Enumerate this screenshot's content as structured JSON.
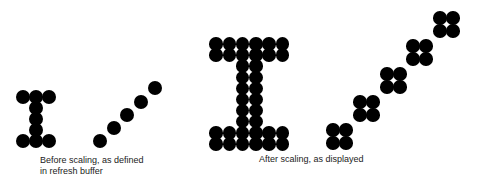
{
  "figure": {
    "left_caption_line1": "Before scaling, as defined",
    "left_caption_line2": "in refresh buffer",
    "right_caption": "After scaling, as displayed",
    "dot_color": "#000000",
    "small_dot_diameter": 14,
    "large_dot_diameter": 13.5,
    "small_I": [
      [
        23,
        97
      ],
      [
        36,
        97
      ],
      [
        49,
        97
      ],
      [
        36,
        108
      ],
      [
        36,
        119
      ],
      [
        36,
        130
      ],
      [
        23,
        141
      ],
      [
        36,
        141
      ],
      [
        49,
        141
      ]
    ],
    "small_diagonal": [
      [
        100,
        141
      ],
      [
        114,
        128
      ],
      [
        127,
        115
      ],
      [
        141,
        102
      ],
      [
        155,
        88
      ]
    ],
    "large_I_origin": [
      216,
      44
    ],
    "large_I_pitch": [
      13.3,
      11.1
    ],
    "large_I_grid": [
      [
        1,
        1,
        1,
        1,
        1,
        1
      ],
      [
        1,
        1,
        1,
        1,
        1,
        1
      ],
      [
        0,
        0,
        1,
        1,
        0,
        0
      ],
      [
        0,
        0,
        1,
        1,
        0,
        0
      ],
      [
        0,
        0,
        1,
        1,
        0,
        0
      ],
      [
        0,
        0,
        1,
        1,
        0,
        0
      ],
      [
        0,
        0,
        1,
        1,
        0,
        0
      ],
      [
        0,
        0,
        1,
        1,
        0,
        0
      ],
      [
        1,
        1,
        1,
        1,
        1,
        1
      ],
      [
        1,
        1,
        1,
        1,
        1,
        1
      ]
    ],
    "large_diagonal_blocks": [
      [
        333,
        130
      ],
      [
        360,
        102
      ],
      [
        387,
        74
      ],
      [
        413,
        46
      ],
      [
        440,
        18
      ]
    ],
    "large_block_pitch": 13
  }
}
